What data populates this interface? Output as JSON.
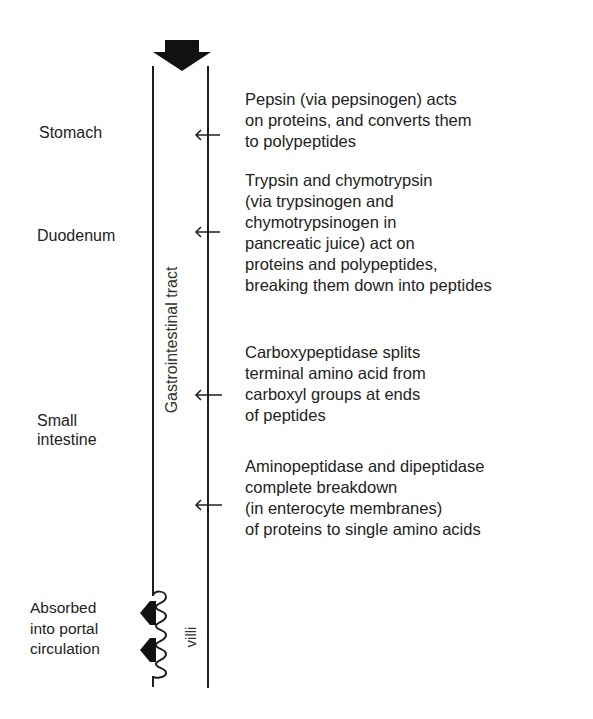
{
  "diagram": {
    "tract_label": "Gastrointestinal tract",
    "villi_label": "villi",
    "regions": [
      {
        "name": "Stomach",
        "lines": [
          "Stomach"
        ]
      },
      {
        "name": "Duodenum",
        "lines": [
          "Duodenum"
        ]
      },
      {
        "name": "Small intestine",
        "lines": [
          "Small",
          "intestine"
        ]
      }
    ],
    "absorption": {
      "lines": [
        "Absorbed",
        "into portal",
        "circulation"
      ]
    },
    "steps": [
      {
        "lines": [
          "Pepsin (via pepsinogen) acts",
          "on proteins, and converts them",
          "to polypeptides"
        ]
      },
      {
        "lines": [
          "Trypsin and chymotrypsin",
          "(via trypsinogen and",
          "chymotrypsinogen in",
          "pancreatic juice) act on",
          "proteins and polypeptides,",
          "breaking them down into peptides"
        ]
      },
      {
        "lines": [
          "Carboxypeptidase splits",
          "terminal amino acid from",
          "carboxyl groups at ends",
          "of peptides"
        ]
      },
      {
        "lines": [
          "Aminopeptidase and dipeptidase",
          "complete breakdown",
          "(in enterocyte membranes)",
          "of proteins to single amino acids"
        ]
      }
    ],
    "colors": {
      "ink": "#1e1e1e",
      "background": "#ffffff"
    }
  }
}
